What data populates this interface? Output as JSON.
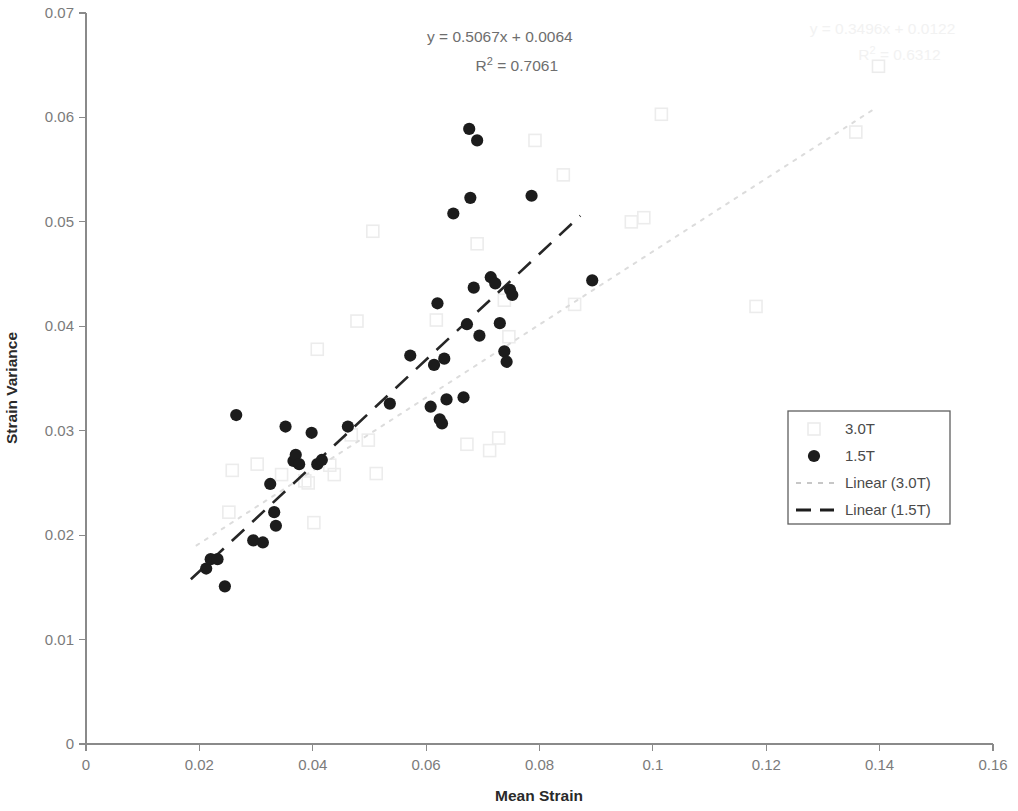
{
  "chart_data": {
    "type": "scatter",
    "title": "",
    "xlabel": "Mean Strain",
    "ylabel": "Strain Variance",
    "xlim": [
      0,
      0.16
    ],
    "ylim": [
      0,
      0.07
    ],
    "grid": false,
    "legend_position": "right-middle",
    "x_ticks": [
      "0",
      "0.02",
      "0.04",
      "0.06",
      "0.08",
      "0.1",
      "0.12",
      "0.14",
      "0.16"
    ],
    "x_tick_values": [
      0,
      0.02,
      0.04,
      0.06,
      0.08,
      0.1,
      0.12,
      0.14,
      0.16
    ],
    "y_ticks": [
      "0",
      "0.01",
      "0.02",
      "0.03",
      "0.04",
      "0.05",
      "0.06",
      "0.07"
    ],
    "y_tick_values": [
      0,
      0.01,
      0.02,
      0.03,
      0.04,
      0.05,
      0.06,
      0.07
    ],
    "series": [
      {
        "name": "1.5T",
        "marker": "filled-circle",
        "color": "#1c1c1c",
        "points": [
          [
            0.0212,
            0.0168
          ],
          [
            0.022,
            0.0177
          ],
          [
            0.0232,
            0.0177
          ],
          [
            0.0245,
            0.0151
          ],
          [
            0.0265,
            0.0315
          ],
          [
            0.0295,
            0.0195
          ],
          [
            0.0312,
            0.0193
          ],
          [
            0.0325,
            0.0249
          ],
          [
            0.0332,
            0.0222
          ],
          [
            0.0335,
            0.0209
          ],
          [
            0.0352,
            0.0304
          ],
          [
            0.0366,
            0.0271
          ],
          [
            0.037,
            0.0277
          ],
          [
            0.0376,
            0.0268
          ],
          [
            0.0398,
            0.0298
          ],
          [
            0.0408,
            0.0268
          ],
          [
            0.0416,
            0.0272
          ],
          [
            0.0462,
            0.0304
          ],
          [
            0.0536,
            0.0326
          ],
          [
            0.0572,
            0.0372
          ],
          [
            0.0608,
            0.0323
          ],
          [
            0.0614,
            0.0363
          ],
          [
            0.062,
            0.0422
          ],
          [
            0.0624,
            0.0311
          ],
          [
            0.0628,
            0.0307
          ],
          [
            0.0632,
            0.0369
          ],
          [
            0.0636,
            0.033
          ],
          [
            0.0648,
            0.0508
          ],
          [
            0.0666,
            0.0332
          ],
          [
            0.0672,
            0.0402
          ],
          [
            0.0676,
            0.0589
          ],
          [
            0.0678,
            0.0523
          ],
          [
            0.0684,
            0.0437
          ],
          [
            0.069,
            0.0578
          ],
          [
            0.0694,
            0.0391
          ],
          [
            0.0714,
            0.0447
          ],
          [
            0.0722,
            0.0441
          ],
          [
            0.073,
            0.0403
          ],
          [
            0.0738,
            0.0376
          ],
          [
            0.0742,
            0.0366
          ],
          [
            0.0748,
            0.0435
          ],
          [
            0.0752,
            0.043
          ],
          [
            0.0786,
            0.0525
          ],
          [
            0.0893,
            0.0444
          ]
        ]
      },
      {
        "name": "3.0T",
        "marker": "open-square",
        "color": "#ececec",
        "points": [
          [
            0.0252,
            0.0222
          ],
          [
            0.0258,
            0.0262
          ],
          [
            0.0302,
            0.0268
          ],
          [
            0.0345,
            0.0258
          ],
          [
            0.0386,
            0.0252
          ],
          [
            0.0392,
            0.025
          ],
          [
            0.0402,
            0.0212
          ],
          [
            0.0408,
            0.0378
          ],
          [
            0.043,
            0.0267
          ],
          [
            0.0438,
            0.0258
          ],
          [
            0.0468,
            0.0296
          ],
          [
            0.0478,
            0.0405
          ],
          [
            0.0498,
            0.0291
          ],
          [
            0.0506,
            0.0491
          ],
          [
            0.0512,
            0.0259
          ],
          [
            0.0618,
            0.0406
          ],
          [
            0.0672,
            0.0287
          ],
          [
            0.069,
            0.0479
          ],
          [
            0.0712,
            0.0281
          ],
          [
            0.0728,
            0.0293
          ],
          [
            0.0738,
            0.0425
          ],
          [
            0.0746,
            0.039
          ],
          [
            0.0792,
            0.0578
          ],
          [
            0.0842,
            0.0545
          ],
          [
            0.0862,
            0.0421
          ],
          [
            0.0962,
            0.05
          ],
          [
            0.0984,
            0.0504
          ],
          [
            0.1015,
            0.0603
          ],
          [
            0.1182,
            0.0419
          ],
          [
            0.1358,
            0.0586
          ],
          [
            0.1398,
            0.0649
          ]
        ]
      }
    ],
    "trendlines": [
      {
        "name": "Linear (1.5T)",
        "style": "dashed",
        "color": "#262626",
        "equation": "y = 0.5067x + 0.0064",
        "r_squared": "R² = 0.7061",
        "slope": 0.5067,
        "intercept": 0.0064,
        "x_from": 0.0185,
        "x_to": 0.0872
      },
      {
        "name": "Linear (3.0T)",
        "style": "dotted",
        "color": "#dcdcdc",
        "equation": "y = 0.3496x + 0.0122",
        "r_squared": "R² = 0.6312",
        "slope": 0.3496,
        "intercept": 0.0122,
        "x_from": 0.0195,
        "x_to": 0.139
      }
    ],
    "annotations": [
      {
        "id": "eq-15t",
        "text": "y = 0.5067x + 0.0064",
        "x": 0.073,
        "y": 0.0672,
        "faint": false
      },
      {
        "id": "r2-15t",
        "text": "R² = 0.7061",
        "x": 0.076,
        "y": 0.0644,
        "faint": false
      },
      {
        "id": "eq-30t",
        "text": "y = 0.3496x + 0.0122",
        "x": 0.1405,
        "y": 0.068,
        "faint": true
      },
      {
        "id": "r2-30t",
        "text": "R² = 0.6312",
        "x": 0.1435,
        "y": 0.0655,
        "faint": true
      }
    ],
    "legend": {
      "entries": [
        {
          "label": "3.0T",
          "type": "marker",
          "marker": "open-square"
        },
        {
          "label": "1.5T",
          "type": "marker",
          "marker": "filled-circle"
        },
        {
          "label": "Linear (3.0T)",
          "type": "line",
          "style": "dotted"
        },
        {
          "label": "Linear (1.5T)",
          "type": "line",
          "style": "dashed"
        }
      ]
    }
  }
}
